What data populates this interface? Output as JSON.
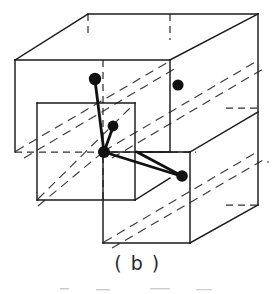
{
  "figure": {
    "caption": "( b )",
    "ink_color": "#1a1a1a",
    "background_color": "#ffffff",
    "node_color": "#111111",
    "stroke_width_solid": 1.4,
    "stroke_width_bond": 2.6
  },
  "geometry": {
    "description": "Two interpenetrating rectangular cells drawn in oblique projection with a small central cell; bold dots mark lattice sites joined by bold bond vectors.",
    "outer_cell_front_face": [
      [
        15,
        60
      ],
      [
        15,
        152
      ],
      [
        170,
        152
      ],
      [
        170,
        60
      ]
    ],
    "outer_cell_top_back": [
      [
        88,
        14
      ],
      [
        258,
        14
      ]
    ],
    "right_cell_front_face": [
      [
        103,
        152
      ],
      [
        103,
        243
      ],
      [
        258,
        243
      ],
      [
        258,
        152
      ]
    ],
    "inner_cell_front_face": [
      [
        37,
        103
      ],
      [
        37,
        200
      ],
      [
        135,
        200
      ],
      [
        135,
        103
      ]
    ],
    "vertical_edges": [
      {
        "name": "outer-left-edge",
        "from": [
          15,
          60
        ],
        "to": [
          15,
          152
        ]
      },
      {
        "name": "outer-mid-edge",
        "from": [
          103,
          60
        ],
        "to": [
          103,
          152
        ]
      },
      {
        "name": "outer-right-edge",
        "from": [
          170,
          60
        ],
        "to": [
          170,
          152
        ]
      },
      {
        "name": "far-right-edge",
        "from": [
          258,
          14
        ],
        "to": [
          258,
          205
        ]
      },
      {
        "name": "inner-left-edge",
        "from": [
          37,
          103
        ],
        "to": [
          37,
          200
        ]
      },
      {
        "name": "inner-right-edge",
        "from": [
          135,
          103
        ],
        "to": [
          135,
          200
        ]
      },
      {
        "name": "lower-mid-edge",
        "from": [
          103,
          152
        ],
        "to": [
          103,
          243
        ]
      },
      {
        "name": "lower-right-edge",
        "from": [
          190,
          152
        ],
        "to": [
          190,
          243
        ]
      }
    ],
    "dashed_hidden_edges": [
      {
        "name": "hidden-top-vertical-left",
        "from": [
          88,
          14
        ],
        "to": [
          88,
          36
        ]
      },
      {
        "name": "hidden-top-vertical-mid",
        "from": [
          170,
          14
        ],
        "to": [
          170,
          38
        ]
      },
      {
        "name": "hidden-left-horizontal",
        "from": [
          15,
          152
        ],
        "to": [
          50,
          152
        ]
      },
      {
        "name": "hidden-center-vertical",
        "from": [
          103,
          60
        ],
        "to": [
          103,
          200
        ]
      },
      {
        "name": "hidden-center-horizontal",
        "from": [
          37,
          152
        ],
        "to": [
          190,
          152
        ]
      },
      {
        "name": "hidden-right-stub",
        "from": [
          228,
          108
        ],
        "to": [
          258,
          108
        ]
      },
      {
        "name": "hidden-right-lower-stub",
        "from": [
          228,
          205
        ],
        "to": [
          258,
          205
        ]
      }
    ],
    "diagonals_dashed": [
      {
        "name": "diag-outer-upper",
        "from": [
          15,
          152
        ],
        "to": [
          170,
          60
        ]
      },
      {
        "name": "diag-outer-upper-2",
        "from": [
          22,
          158
        ],
        "to": [
          176,
          66
        ]
      },
      {
        "name": "diag-mid-right",
        "from": [
          103,
          152
        ],
        "to": [
          258,
          60
        ]
      },
      {
        "name": "diag-mid-right-2",
        "from": [
          110,
          158
        ],
        "to": [
          264,
          66
        ]
      },
      {
        "name": "diag-lower-right",
        "from": [
          103,
          243
        ],
        "to": [
          258,
          152
        ]
      },
      {
        "name": "diag-inner",
        "from": [
          37,
          200
        ],
        "to": [
          135,
          103
        ]
      }
    ],
    "solid_diagonals": [
      {
        "name": "edge-top-left-ridge",
        "from": [
          15,
          60
        ],
        "to": [
          88,
          14
        ]
      },
      {
        "name": "edge-top-mid-ridge",
        "from": [
          103,
          60
        ],
        "to": [
          176,
          14
        ]
      },
      {
        "name": "edge-top-right-ridge",
        "from": [
          170,
          60
        ],
        "to": [
          258,
          14
        ]
      },
      {
        "name": "edge-inner-ridge",
        "from": [
          37,
          200
        ],
        "to": [
          103,
          152
        ]
      },
      {
        "name": "edge-lower-right-ridge",
        "from": [
          190,
          243
        ],
        "to": [
          258,
          205
        ]
      },
      {
        "name": "edge-inner-top-ridge",
        "from": [
          37,
          103
        ],
        "to": [
          103,
          60
        ]
      }
    ]
  },
  "nodes": [
    {
      "name": "node-upper-left",
      "cx": 95,
      "cy": 79,
      "r": 6.2,
      "label": "lattice-site-1"
    },
    {
      "name": "node-upper-right",
      "cx": 178,
      "cy": 85,
      "r": 5.6,
      "label": "lattice-site-2"
    },
    {
      "name": "node-middle",
      "cx": 113,
      "cy": 126,
      "r": 5.4,
      "label": "lattice-site-3"
    },
    {
      "name": "node-center",
      "cx": 104,
      "cy": 152,
      "r": 6.0,
      "label": "lattice-site-origin"
    },
    {
      "name": "node-lower-right",
      "cx": 182,
      "cy": 176,
      "r": 5.8,
      "label": "lattice-site-4"
    }
  ],
  "bonds": [
    {
      "name": "bond-center-to-upper-left",
      "from": [
        104,
        152
      ],
      "to": [
        95,
        79
      ]
    },
    {
      "name": "bond-center-to-middle",
      "from": [
        104,
        152
      ],
      "to": [
        113,
        126
      ]
    },
    {
      "name": "bond-center-to-lower-right",
      "from": [
        104,
        152
      ],
      "to": [
        182,
        176
      ]
    },
    {
      "name": "bond-lower-right-to-upper",
      "from": [
        182,
        176
      ],
      "to": [
        136,
        152
      ]
    }
  ]
}
